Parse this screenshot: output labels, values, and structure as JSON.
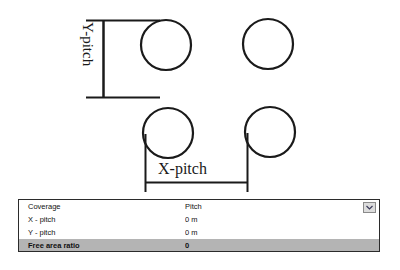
{
  "diagram": {
    "name": "pitch-layout-diagram",
    "y_dimension_label": "Y-pitch",
    "x_dimension_label": "X-pitch",
    "stroke_color": "#1a1a1a",
    "circles": [
      {
        "id": "circle-top-left",
        "cx": 166,
        "cy": 45,
        "r": 25
      },
      {
        "id": "circle-top-right",
        "cx": 268,
        "cy": 44,
        "r": 25
      },
      {
        "id": "circle-bottom-left",
        "cx": 168,
        "cy": 133,
        "r": 25
      },
      {
        "id": "circle-bottom-right",
        "cx": 270,
        "cy": 132,
        "r": 25
      }
    ]
  },
  "properties_table": {
    "name": "coverage-properties-table",
    "selected_row_color": "#b4b4b4",
    "rows": [
      {
        "name": "Coverage",
        "value": "Pitch",
        "selected": false
      },
      {
        "name": "X - pitch",
        "value": "0 m",
        "selected": false
      },
      {
        "name": "Y - pitch",
        "value": "0 m",
        "selected": false
      },
      {
        "name": "Free area ratio",
        "value": "0",
        "selected": true
      }
    ],
    "dropdown_icon": "chevron-down-icon"
  }
}
